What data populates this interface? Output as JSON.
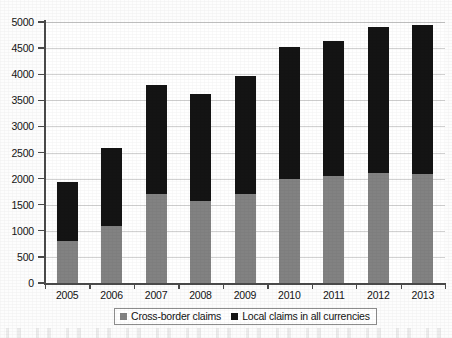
{
  "chart_data": {
    "type": "bar",
    "subtype": "stacked-vertical",
    "title": "",
    "subtitle": "",
    "xlabel": "",
    "ylabel": "",
    "categories": [
      "2005",
      "2006",
      "2007",
      "2008",
      "2009",
      "2010",
      "2011",
      "2012",
      "2013"
    ],
    "series": [
      {
        "name": "Cross-border claims",
        "color": "#828282",
        "values": [
          810,
          1100,
          1710,
          1570,
          1700,
          1990,
          2060,
          2110,
          2090
        ]
      },
      {
        "name": "Local claims in all currencies",
        "color": "#141414",
        "values": [
          1120,
          1480,
          2090,
          2060,
          2270,
          2530,
          2580,
          2800,
          2850
        ]
      }
    ],
    "totals": [
      1930,
      2580,
      3800,
      3630,
      3970,
      4520,
      4640,
      4910,
      4940
    ],
    "ylim": [
      0,
      5000
    ],
    "ytick_step": 500,
    "yticks": [
      0,
      500,
      1000,
      1500,
      2000,
      2500,
      3000,
      3500,
      4000,
      4500,
      5000
    ],
    "ytick_labels": [
      "0",
      "500",
      "1000",
      "1500",
      "2000",
      "2500",
      "3000",
      "3500",
      "4000",
      "4500",
      "5000"
    ],
    "grid": true,
    "grid_axis": "y",
    "legend_position": "bottom",
    "legend_entries": [
      {
        "label": "Cross-border claims",
        "swatch": "gray-square-icon",
        "color": "#828282"
      },
      {
        "label": "Local claims in all currencies",
        "swatch": "black-square-icon",
        "color": "#141414"
      }
    ]
  },
  "colors": {
    "cross_border": "#828282",
    "local_claims": "#141414",
    "axis": "#4a4a4a",
    "grid": "#d2d2d2",
    "background": "#ffffff",
    "text": "#141414"
  }
}
